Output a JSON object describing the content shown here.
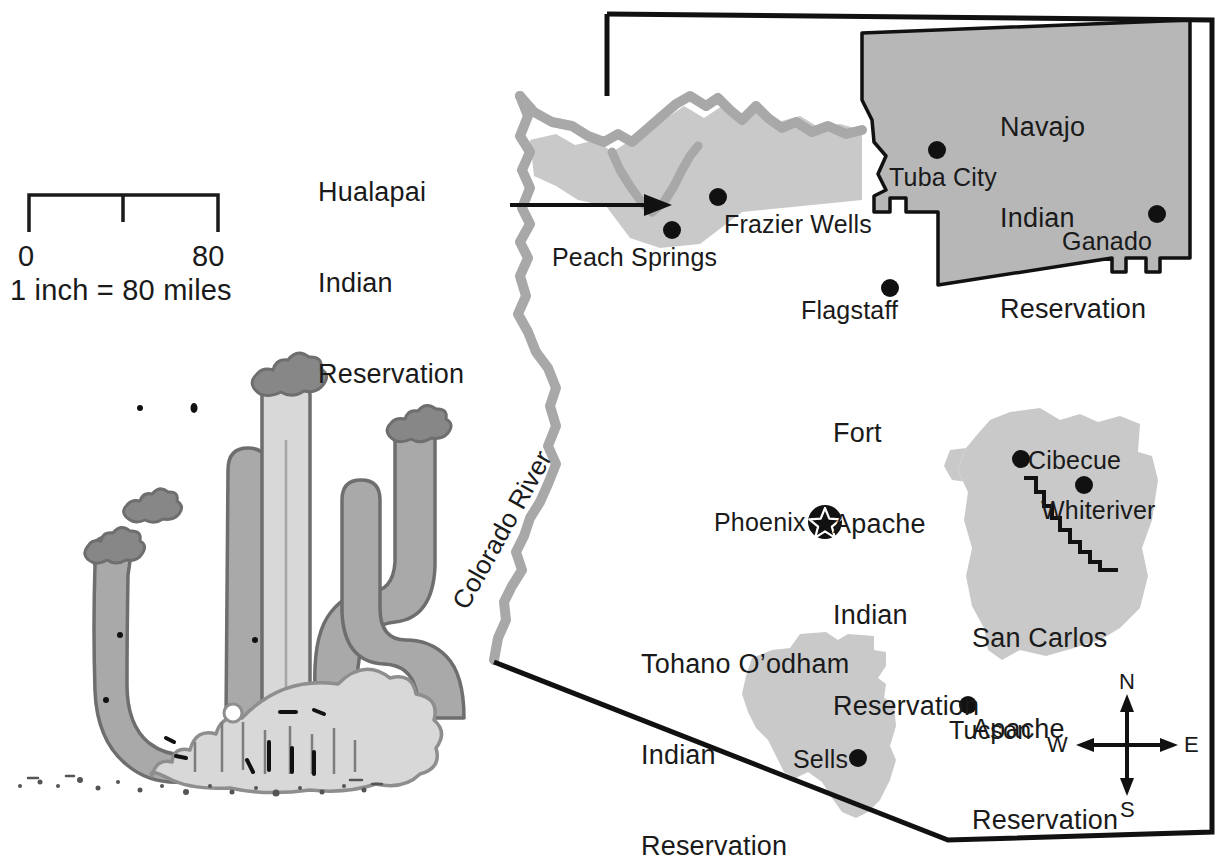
{
  "map": {
    "title": "Arizona Indian Reservations",
    "state": "Arizona",
    "colors": {
      "reservation_light": "#c9c9c9",
      "reservation_dark": "#b0b0b0",
      "river": "#a8a8a8",
      "border": "#111111",
      "text": "#1a1a1a",
      "cactus_light": "#d8d8d8",
      "cactus_dark": "#a9a9a9",
      "cactus_outline": "#6e6e6e",
      "background": "#ffffff"
    },
    "reservations": [
      {
        "name": "Hualapai Indian Reservation",
        "lines": [
          "Hualapai",
          "Indian",
          "Reservation"
        ],
        "shade": "light",
        "leader_line": true
      },
      {
        "name": "Navajo Indian Reservation",
        "lines": [
          "Navajo",
          "Indian",
          "Reservation"
        ],
        "shade": "dark",
        "leader_line": false
      },
      {
        "name": "Fort Apache Indian Reservation",
        "lines": [
          "Fort",
          "Apache",
          "Indian",
          "Reservation"
        ],
        "shade": "light",
        "leader_line": false
      },
      {
        "name": "San Carlos Apache Reservation",
        "lines": [
          "San Carlos",
          "Apache",
          "Reservation"
        ],
        "shade": "light",
        "leader_line": false
      },
      {
        "name": "Tohano O’odham Indian Reservation",
        "lines": [
          "Tohano O’odham",
          "Indian",
          "Reservation"
        ],
        "shade": "light",
        "leader_line": false
      }
    ],
    "cities": [
      {
        "name": "Peach Springs",
        "marker": "dot",
        "x": 672,
        "y": 230,
        "label_x": 552,
        "label_y": 243
      },
      {
        "name": "Frazier Wells",
        "marker": "dot",
        "x": 718,
        "y": 197,
        "label_x": 724,
        "label_y": 210
      },
      {
        "name": "Tuba City",
        "marker": "dot",
        "x": 937,
        "y": 150,
        "label_x": 889,
        "label_y": 163
      },
      {
        "name": "Ganado",
        "marker": "dot",
        "x": 1157,
        "y": 214,
        "label_x": 1062,
        "label_y": 227
      },
      {
        "name": "Flagstaff",
        "marker": "dot",
        "x": 890,
        "y": 288,
        "label_x": 801,
        "label_y": 301
      },
      {
        "name": "Cibecue",
        "marker": "dot",
        "x": 1021,
        "y": 459,
        "label_x": 1028,
        "label_y": 447
      },
      {
        "name": "Whiteriver",
        "marker": "dot",
        "x": 1084,
        "y": 485,
        "label_x": 1041,
        "label_y": 498
      },
      {
        "name": "Phoenix",
        "marker": "capital-star",
        "x": 825,
        "y": 522,
        "label_x": 714,
        "label_y": 519
      },
      {
        "name": "Tucson",
        "marker": "dot",
        "x": 968,
        "y": 705,
        "label_x": 949,
        "label_y": 718
      },
      {
        "name": "Sells",
        "marker": "dot",
        "x": 858,
        "y": 758,
        "label_x": 795,
        "label_y": 746
      }
    ],
    "river": {
      "name": "Colorado River",
      "label_rotation_deg": -60
    },
    "scale_bar": {
      "start_label": "0",
      "end_label": "80",
      "caption": "1 inch = 80 miles",
      "units": "miles",
      "max_value": 80,
      "ticks": [
        0,
        40,
        80
      ]
    },
    "compass": {
      "north": "N",
      "south": "S",
      "east": "E",
      "west": "W"
    },
    "illustration": {
      "name": "saguaro-cactus",
      "description": "Saguaro cactus with rocky base"
    }
  }
}
